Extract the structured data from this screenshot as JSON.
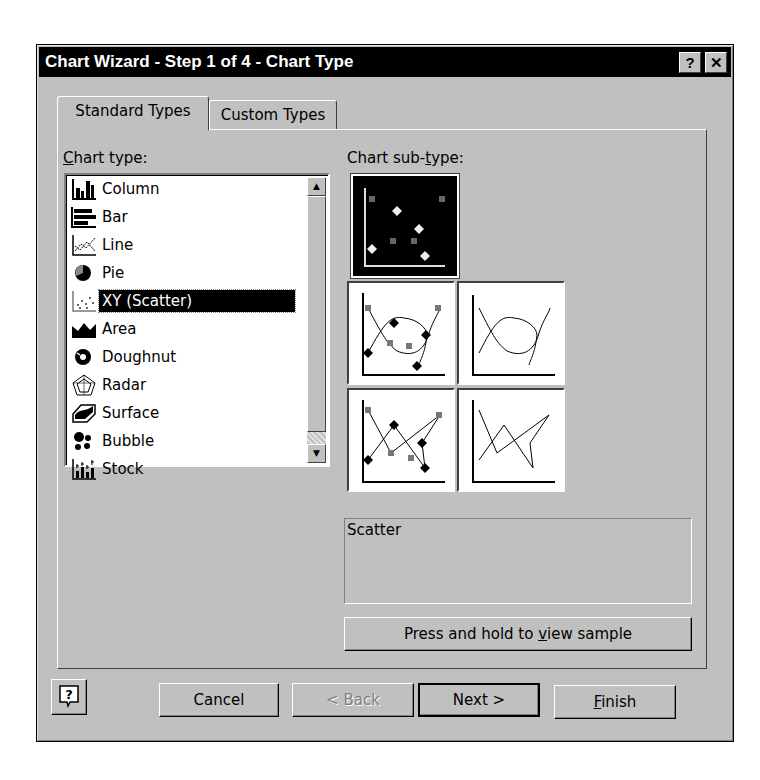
{
  "window": {
    "title": "Chart Wizard - Step 1 of 4 - Chart Type",
    "help_button": "?",
    "close_button": "✕"
  },
  "tabs": [
    {
      "label": "Standard Types",
      "active": true
    },
    {
      "label": "Custom Types",
      "active": false
    }
  ],
  "chart_type": {
    "label_prefix": "C",
    "label_rest": "hart type:",
    "items": [
      {
        "label": "Column",
        "icon": "column-chart-icon"
      },
      {
        "label": "Bar",
        "icon": "bar-chart-icon"
      },
      {
        "label": "Line",
        "icon": "line-chart-icon"
      },
      {
        "label": "Pie",
        "icon": "pie-chart-icon"
      },
      {
        "label": "XY (Scatter)",
        "icon": "scatter-chart-icon",
        "selected": true
      },
      {
        "label": "Area",
        "icon": "area-chart-icon"
      },
      {
        "label": "Doughnut",
        "icon": "doughnut-chart-icon"
      },
      {
        "label": "Radar",
        "icon": "radar-chart-icon"
      },
      {
        "label": "Surface",
        "icon": "surface-chart-icon"
      },
      {
        "label": "Bubble",
        "icon": "bubble-chart-icon"
      },
      {
        "label": "Stock",
        "icon": "stock-chart-icon"
      }
    ]
  },
  "chart_subtype": {
    "label_prefix": "Chart sub-",
    "label_u": "t",
    "label_rest": "ype:",
    "options": [
      {
        "name": "scatter-markers-only",
        "selected": true
      },
      {
        "name": "scatter-smoothed-lines-markers",
        "selected": false
      },
      {
        "name": "scatter-smoothed-lines-no-markers",
        "selected": false
      },
      {
        "name": "scatter-lines-markers",
        "selected": false
      },
      {
        "name": "scatter-lines-no-markers",
        "selected": false
      }
    ],
    "description": "Scatter"
  },
  "sample_button": {
    "label_prefix": "Press and hold to ",
    "label_u": "v",
    "label_rest": "iew sample"
  },
  "footer": {
    "help_icon": "?",
    "cancel": "Cancel",
    "back": "< Back",
    "next": "Next >",
    "finish_u": "F",
    "finish_rest": "inish"
  },
  "colors": {
    "face": "#c0c0c0",
    "titlebar": "#000000",
    "selection": "#000000"
  }
}
